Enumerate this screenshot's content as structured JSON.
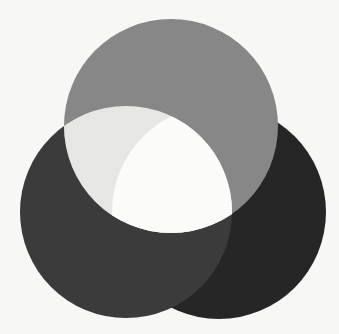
{
  "figure": {
    "background": "#f7f7f5",
    "circles": [
      {
        "id": "top",
        "cx": 171,
        "cy": 126,
        "r": 107,
        "color": "#878787"
      },
      {
        "id": "left",
        "cx": 126,
        "cy": 212,
        "r": 106,
        "color": "#3b3b3b"
      },
      {
        "id": "right",
        "cx": 219,
        "cy": 212,
        "r": 107,
        "color": "#262626"
      }
    ],
    "overlaps": {
      "top_left": "#e6e6e4",
      "top_left_right": "#fbfbfa",
      "top_right": "#878787",
      "left_right": "#3b3b3b"
    }
  }
}
